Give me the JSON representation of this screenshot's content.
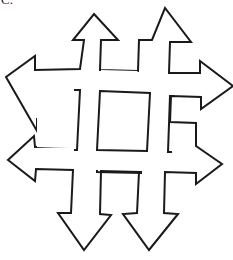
{
  "figure": {
    "label": "C.",
    "stroke_color": "#1a1a1a",
    "fill_color": "#ffffff",
    "arrows": [
      {
        "id": "up-left",
        "direction": "up"
      },
      {
        "id": "up-right",
        "direction": "up"
      },
      {
        "id": "left-top",
        "direction": "left"
      },
      {
        "id": "left-bottom",
        "direction": "left"
      },
      {
        "id": "right-top",
        "direction": "right"
      },
      {
        "id": "right-bottom",
        "direction": "right"
      },
      {
        "id": "down-left",
        "direction": "down"
      },
      {
        "id": "down-right",
        "direction": "down"
      }
    ],
    "inner_shapes": [
      "center-square",
      "top-rectangle",
      "left-rectangle",
      "right-rectangle",
      "bottom-rectangle"
    ]
  }
}
